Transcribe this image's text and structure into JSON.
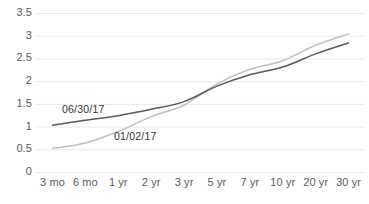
{
  "chart_data": {
    "type": "line",
    "title": "",
    "subtitle": "",
    "xlabel": "",
    "ylabel": "",
    "categories": [
      "3 mo",
      "6 mo",
      "1 yr",
      "2 yr",
      "3 yr",
      "5 yr",
      "7 yr",
      "10 yr",
      "20 yr",
      "30 yr"
    ],
    "series": [
      {
        "name": "01/02/17",
        "color": "#bfbfbf",
        "values": [
          0.52,
          0.64,
          0.89,
          1.22,
          1.47,
          1.94,
          2.26,
          2.45,
          2.79,
          3.04
        ]
      },
      {
        "name": "06/30/17",
        "color": "#595959",
        "values": [
          1.03,
          1.14,
          1.24,
          1.38,
          1.55,
          1.89,
          2.14,
          2.31,
          2.6,
          2.84
        ]
      }
    ],
    "ylim": [
      0,
      3.5
    ],
    "yticks": [
      "0",
      "0.5",
      "1",
      "1.5",
      "2",
      "2.5",
      "3",
      "3.5"
    ],
    "ytick_values": [
      0,
      0.5,
      1,
      1.5,
      2,
      2.5,
      3,
      3.5
    ],
    "grid": true,
    "grid_axis": "y",
    "grid_color": "#e8e8e8",
    "legend": "none",
    "annotations": [
      {
        "text": "06/30/17",
        "series": "06/30/17"
      },
      {
        "text": "01/02/17",
        "series": "01/02/17"
      }
    ],
    "background": "#ffffff"
  }
}
